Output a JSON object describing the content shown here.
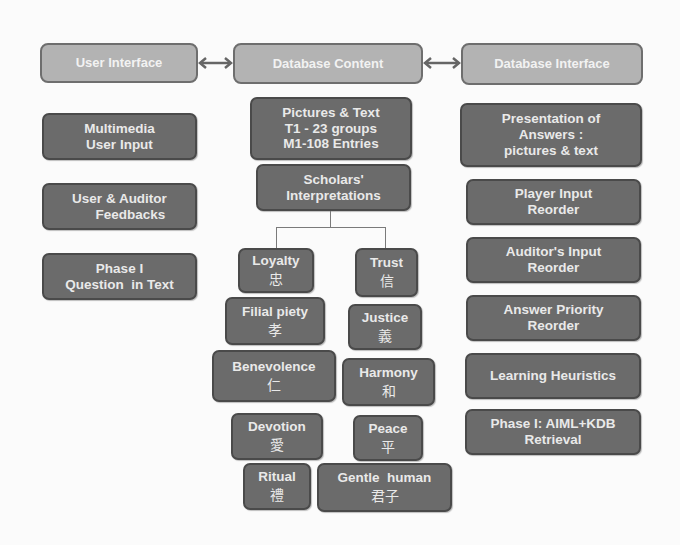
{
  "headers": {
    "user_interface": "User Interface",
    "database_content": "Database Content",
    "database_interface": "Database Interface"
  },
  "arrows": [
    {
      "name": "bidirectional-arrow",
      "from": "User Interface",
      "to": "Database Content"
    },
    {
      "name": "bidirectional-arrow",
      "from": "Database Content",
      "to": "Database Interface"
    }
  ],
  "left_column": [
    {
      "line1": "Multimedia",
      "line2": "User Input"
    },
    {
      "line1": "User & Auditor",
      "line2": "Feedbacks"
    },
    {
      "line1": "Phase I",
      "line2": "Question  in Text"
    }
  ],
  "center_column": {
    "content": {
      "line1": "Pictures & Text",
      "line2": "T1 - 23 groups",
      "line3": "M1-108 Entries"
    },
    "scholars": {
      "line1": "Scholars'",
      "line2": "Interpretations"
    },
    "values_left": [
      {
        "en": "Loyalty",
        "zh": "忠"
      },
      {
        "en": "Filial piety",
        "zh": "孝"
      },
      {
        "en": "Benevolence",
        "zh": "仁"
      },
      {
        "en": "Devotion",
        "zh": "愛"
      },
      {
        "en": "Ritual",
        "zh": "禮"
      }
    ],
    "values_right": [
      {
        "en": "Trust",
        "zh": "信"
      },
      {
        "en": "Justice",
        "zh": "義"
      },
      {
        "en": "Harmony",
        "zh": "和"
      },
      {
        "en": "Peace",
        "zh": "平"
      },
      {
        "en": "Gentle  human",
        "zh": "君子"
      }
    ]
  },
  "right_column": [
    {
      "line1": "Presentation of",
      "line2": "Answers :",
      "line3": "pictures & text"
    },
    {
      "line1": "Player Input",
      "line2": "Reorder"
    },
    {
      "line1": "Auditor's Input",
      "line2": "Reorder"
    },
    {
      "line1": "Answer Priority",
      "line2": "Reorder"
    },
    {
      "line1": "Learning Heuristics"
    },
    {
      "line1": "Phase I: AIML+KDB",
      "line2": "Retrieval"
    }
  ],
  "colors": {
    "header_fill": "#b3b3b3",
    "box_fill": "#6b6b6b",
    "text": "#e9e9e9",
    "background": "#fbfbfb"
  }
}
